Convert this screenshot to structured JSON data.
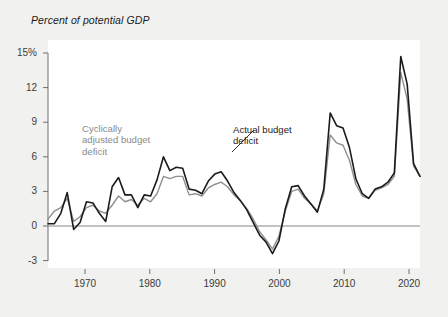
{
  "figure": {
    "axis_title": "Percent of potential GDP",
    "background_color": "#f1f1ef",
    "plot_background_color": "#ffffff"
  },
  "annotations": {
    "cyclical": {
      "text": "Cyclically\nadjusted budget\ndeficit",
      "color": "#8a8a8a"
    },
    "actual": {
      "text": "Actual budget\ndeficit",
      "color": "#1b1b1b"
    }
  },
  "chart_data": {
    "type": "line",
    "title": "",
    "subtitle": "",
    "xlabel": "",
    "ylabel": "Percent of potential GDP",
    "xlim": [
      1965,
      2023
    ],
    "ylim": [
      -4.2,
      16.2
    ],
    "xticks": [
      1970,
      1980,
      1990,
      2000,
      2010,
      2020
    ],
    "xtick_labels": [
      "1970",
      "1980",
      "1990",
      "2000",
      "2010",
      "2020"
    ],
    "yticks": [
      -3,
      0,
      3,
      6,
      9,
      12,
      15
    ],
    "ytick_labels": [
      "-3",
      "0",
      "3",
      "6",
      "9",
      "12",
      "15%"
    ],
    "grid": false,
    "zero_line": true,
    "legend": "annotated-inline",
    "x": [
      1965,
      1966,
      1967,
      1968,
      1969,
      1970,
      1971,
      1972,
      1973,
      1974,
      1975,
      1976,
      1977,
      1978,
      1979,
      1980,
      1981,
      1982,
      1983,
      1984,
      1985,
      1986,
      1987,
      1988,
      1989,
      1990,
      1991,
      1992,
      1993,
      1994,
      1995,
      1996,
      1997,
      1998,
      1999,
      2000,
      2001,
      2002,
      2003,
      2004,
      2005,
      2006,
      2007,
      2008,
      2009,
      2010,
      2011,
      2012,
      2013,
      2014,
      2015,
      2016,
      2017,
      2018,
      2019,
      2020,
      2021,
      2022,
      2023
    ],
    "series": [
      {
        "name": "Actual budget deficit",
        "color": "#1b1b1b",
        "width": 1.6,
        "values": [
          0.2,
          0.2,
          1.1,
          2.9,
          -0.3,
          0.3,
          2.1,
          2.0,
          1.1,
          0.4,
          3.4,
          4.2,
          2.7,
          2.7,
          1.6,
          2.7,
          2.6,
          4.0,
          6.0,
          4.8,
          5.1,
          5.0,
          3.2,
          3.1,
          2.8,
          3.9,
          4.5,
          4.7,
          3.9,
          2.9,
          2.2,
          1.4,
          0.3,
          -0.8,
          -1.4,
          -2.4,
          -1.3,
          1.5,
          3.4,
          3.5,
          2.6,
          1.9,
          1.2,
          3.2,
          9.8,
          8.7,
          8.5,
          6.8,
          4.1,
          2.8,
          2.4,
          3.2,
          3.4,
          3.8,
          4.6,
          14.7,
          12.3,
          5.4,
          4.3
        ]
      },
      {
        "name": "Cyclically adjusted budget deficit",
        "color": "#8f8f8f",
        "width": 1.4,
        "values": [
          0.6,
          1.3,
          1.6,
          2.4,
          0.4,
          0.8,
          1.6,
          1.8,
          1.3,
          1.1,
          1.8,
          2.6,
          2.1,
          2.3,
          1.8,
          2.4,
          2.1,
          2.8,
          4.3,
          4.1,
          4.3,
          4.3,
          2.7,
          2.8,
          2.6,
          3.3,
          3.6,
          3.8,
          3.4,
          2.7,
          2.2,
          1.5,
          0.6,
          -0.5,
          -1.2,
          -2.0,
          -0.9,
          1.3,
          3.0,
          3.2,
          2.4,
          1.9,
          1.3,
          2.8,
          7.9,
          7.2,
          7.0,
          5.7,
          3.6,
          2.6,
          2.4,
          3.1,
          3.3,
          3.6,
          4.3,
          13.3,
          11.0,
          5.2,
          4.3
        ]
      }
    ]
  }
}
